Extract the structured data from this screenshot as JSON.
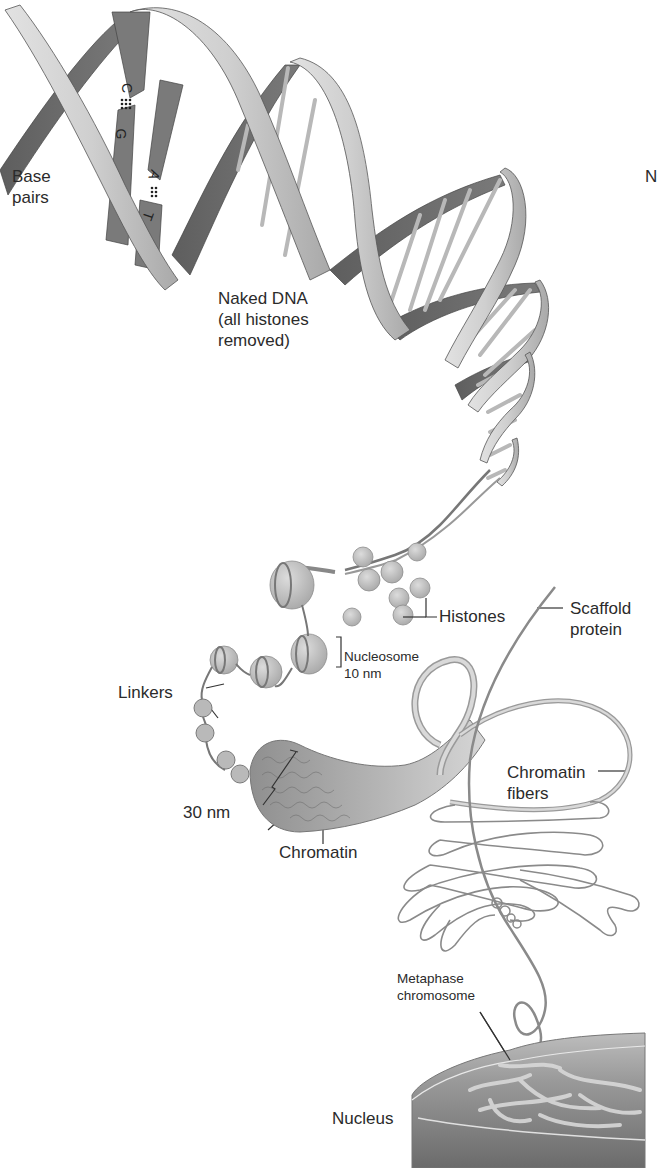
{
  "figure": {
    "colors": {
      "background": "#ffffff",
      "ribbon_light": "#c9c9c9",
      "ribbon_dark": "#6f6f6f",
      "rung": "#bdbdbd",
      "histone": "#c4c4c4",
      "fiber": "#8a8a8a",
      "nucleus": "#8c8c8c",
      "label_text": "#2b2b2b"
    }
  },
  "labels": {
    "base_pairs": [
      "Base",
      "pairs"
    ],
    "naked_dna": [
      "Naked DNA",
      "(all histones",
      "removed)"
    ],
    "histones": "Histones",
    "scaffold_protein": [
      "Scaffold",
      "protein"
    ],
    "nucleosome": [
      "Nucleosome",
      "10 nm"
    ],
    "linkers": "Linkers",
    "chromatin_fibers": [
      "Chromatin",
      "fibers"
    ],
    "thirty_nm": "30 nm",
    "chromatin": "Chromatin",
    "metaphase_chromosome": [
      "Metaphase",
      "chromosome"
    ],
    "nucleus": "Nucleus",
    "edge_fragment": "N"
  },
  "base_pair_letters": {
    "top_pair": [
      "C",
      "G"
    ],
    "bottom_pair": [
      "A",
      "T"
    ]
  }
}
